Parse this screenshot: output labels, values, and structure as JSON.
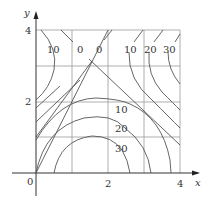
{
  "figure": {
    "type": "contour-map",
    "axes": {
      "x_label": "x",
      "y_label": "y",
      "origin_label": "0",
      "x_ticks": [
        {
          "value": 2,
          "label": "2"
        },
        {
          "value": 4,
          "label": "4"
        }
      ],
      "y_ticks": [
        {
          "value": 2,
          "label": "2"
        },
        {
          "value": 4,
          "label": "4"
        }
      ],
      "xlim": [
        0,
        4
      ],
      "ylim": [
        0,
        4
      ],
      "grid": "unit grid, 1x1 squares"
    },
    "contour_labels": {
      "top_left_10": "10",
      "top_0_a": "0",
      "top_0_b": "0",
      "top_right_10": "10",
      "top_right_20": "20",
      "top_right_30": "30",
      "mid_10": "10",
      "mid_20": "20",
      "mid_30": "30"
    }
  }
}
